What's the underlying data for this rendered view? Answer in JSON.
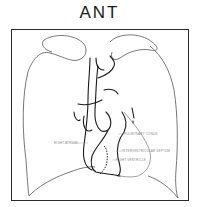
{
  "title": "ANT",
  "diagram": {
    "view": "anterior",
    "labels": [
      {
        "id": "right-atrium",
        "text": "RIGHT ATRIUM"
      },
      {
        "id": "pulmonary-conus",
        "text": "PULMONARY CONUS"
      },
      {
        "id": "interventricular-septum",
        "text": "INTERVENTRICULAR SEPTUM"
      },
      {
        "id": "right-ventricle",
        "text": "RIGHT VENTRICLE"
      }
    ],
    "colors": {
      "line": "#1a1a1a",
      "outline": "#555555",
      "label": "#8a8a8a",
      "background": "#ffffff"
    }
  }
}
